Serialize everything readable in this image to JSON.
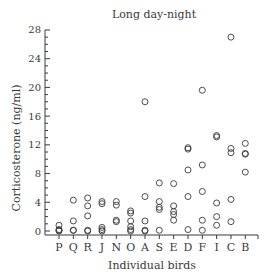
{
  "chart_data": {
    "type": "scatter",
    "title": "Long day-night",
    "xlabel": "Individual birds",
    "ylabel": "Corticosterone (ng/ml)",
    "ylim": [
      0,
      28
    ],
    "yticks": [
      0,
      4,
      8,
      12,
      16,
      20,
      24,
      28
    ],
    "ytick_labels": [
      "0",
      "4",
      "8",
      "12",
      "16",
      "20",
      "24",
      "28"
    ],
    "y_minor_step": 1,
    "grid": false,
    "legend": null,
    "marker": "open-circle",
    "categories": [
      "P",
      "Q",
      "R",
      "J",
      "N",
      "O",
      "A",
      "S",
      "E",
      "D",
      "F",
      "I",
      "C",
      "B"
    ],
    "points": {
      "P": [
        0.8,
        0.2,
        0.1,
        0.0
      ],
      "Q": [
        4.3,
        1.4,
        0.1,
        0.1
      ],
      "R": [
        4.6,
        3.5,
        2.1,
        0.1,
        0.0
      ],
      "J": [
        4.1,
        3.8,
        0.5,
        0.2,
        0.0
      ],
      "N": [
        4.1,
        3.6,
        1.5,
        1.3
      ],
      "O": [
        2.8,
        2.5,
        1.4,
        0.6,
        0.2,
        0.0
      ],
      "A": [
        18.0,
        4.8,
        1.4,
        0.1,
        0.0
      ],
      "S": [
        6.7,
        4.1,
        3.3,
        3.0,
        0.1
      ],
      "E": [
        6.6,
        3.5,
        2.7,
        2.3,
        1.5
      ],
      "D": [
        11.6,
        11.4,
        8.5,
        4.8,
        0.2
      ],
      "F": [
        19.6,
        9.2,
        5.5,
        1.5,
        0.1
      ],
      "I": [
        13.3,
        13.1,
        3.9,
        2.0,
        0.8
      ],
      "C": [
        27.0,
        11.5,
        10.9,
        4.4,
        1.3
      ],
      "B": [
        12.2,
        10.8,
        10.7,
        8.2
      ]
    }
  },
  "colors": {
    "ink": "#3a3a3a",
    "background": "#ffffff"
  }
}
